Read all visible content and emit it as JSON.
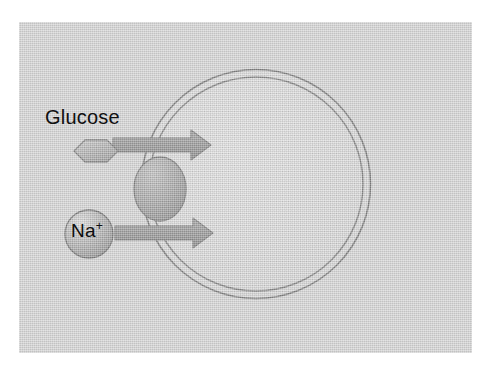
{
  "figure": {
    "panel_background": "#d2d2d2",
    "canvas": {
      "width": 490,
      "height": 378
    }
  },
  "labels": {
    "glucose": "Glucose",
    "sodium_base": "Na",
    "sodium_charge": "+"
  },
  "molecules": [
    {
      "name": "glucose-hexagon",
      "shape": "hexagon",
      "label": "Glucose",
      "fill": "#a9a9a9",
      "stroke": "#6e6e6e",
      "center": {
        "x": 85,
        "y": 151
      },
      "radius": 22
    },
    {
      "name": "sodium-ion-sphere",
      "shape": "circle",
      "label": "Na+",
      "fill": "#b0b0b0",
      "stroke": "#5f5f5f",
      "center": {
        "x": 89,
        "y": 234
      },
      "radius": 24
    }
  ],
  "cell": {
    "name": "cell-membrane",
    "shape": "double-line-circle",
    "center": {
      "x": 256,
      "y": 184
    },
    "outer_radius": 115,
    "inner_radius": 108,
    "stroke": "#6b6b6b",
    "interior_fill": "#d8d8d8"
  },
  "transporter": {
    "name": "membrane-transport-protein",
    "shape": "ellipse",
    "center": {
      "x": 160,
      "y": 189
    },
    "rx": 26,
    "ry": 32,
    "fill": "#9e9e9e",
    "stroke": "#6a6a6a"
  },
  "arrows": [
    {
      "name": "glucose-transport-arrow",
      "direction": "right",
      "from": {
        "x": 113,
        "y": 145
      },
      "to": {
        "x": 211,
        "y": 145
      },
      "shaft_height": 14,
      "fill": "#8f8f8f",
      "stroke": "#6d6d6d"
    },
    {
      "name": "sodium-transport-arrow",
      "direction": "right",
      "from": {
        "x": 115,
        "y": 233
      },
      "to": {
        "x": 213,
        "y": 233
      },
      "shaft_height": 14,
      "fill": "#8f8f8f",
      "stroke": "#6d6d6d"
    }
  ],
  "colors": {
    "panel": "#d2d2d2",
    "cell_interior": "#d8d8d8",
    "membrane_line": "#6b6b6b",
    "arrow": "#8f8f8f",
    "molecule": "#a9a9a9",
    "text": "#101010"
  }
}
